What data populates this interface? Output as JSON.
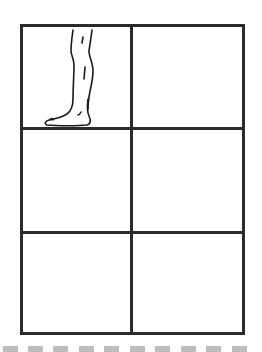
{
  "worksheet": {
    "grid": {
      "rows": 3,
      "columns": 2,
      "border_color": "#2b2b2b",
      "cells": [
        {
          "row": 0,
          "col": 0,
          "content": "leg-drawing"
        },
        {
          "row": 0,
          "col": 1,
          "content": ""
        },
        {
          "row": 1,
          "col": 0,
          "content": ""
        },
        {
          "row": 1,
          "col": 1,
          "content": ""
        },
        {
          "row": 2,
          "col": 0,
          "content": ""
        },
        {
          "row": 2,
          "col": 1,
          "content": ""
        }
      ]
    },
    "illustration": {
      "subject": "leg-and-foot-line-drawing",
      "stroke_color": "#1a1a1a"
    },
    "cut_line": {
      "style": "dashed",
      "color": "#bdbdbd",
      "dash_count": 10
    }
  }
}
